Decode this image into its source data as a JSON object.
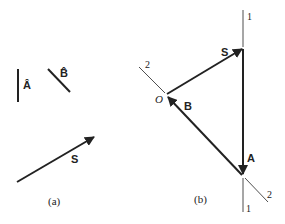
{
  "panel_a": {
    "caption": "(a)",
    "unit_a_label": "Â",
    "unit_b_label": "B̂",
    "vector_s_label": "S"
  },
  "panel_b": {
    "caption": "(b)",
    "vector_s_label": "S",
    "vector_a_label": "A",
    "vector_b_label": "B",
    "origin_label": "O",
    "axis1_top_label": "1",
    "axis1_bottom_label": "1",
    "axis2_top_label": "2",
    "axis2_bottom_label": "2"
  },
  "colors": {
    "ink": "#222222",
    "background": "#ffffff"
  }
}
